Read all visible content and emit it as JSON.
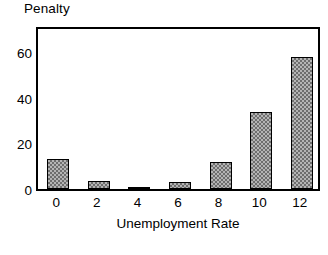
{
  "chart_data": {
    "type": "bar",
    "title": "Penalty",
    "xlabel": "Unemployment Rate",
    "ylabel": "Penalty",
    "categories": [
      "0",
      "2",
      "4",
      "6",
      "8",
      "10",
      "12"
    ],
    "values": [
      13,
      3.5,
      0.3,
      3,
      12,
      34,
      58
    ],
    "xtick_labels": [
      "0",
      "2",
      "4",
      "6",
      "8",
      "10",
      "12"
    ],
    "ytick_labels": [
      "0",
      "20",
      "40",
      "60"
    ],
    "ytick_values": [
      0,
      20,
      40,
      60
    ],
    "ylim": [
      0,
      72
    ],
    "xlim": [
      -1,
      13
    ],
    "grid": false,
    "legend": null,
    "series": [
      {
        "name": "Penalty",
        "values": [
          13,
          3.5,
          0.3,
          3,
          12,
          34,
          58
        ]
      }
    ],
    "bar_fill": "#b4b4b4",
    "bar_edge": "#000000",
    "frame_color": "#000000",
    "background": "#ffffff"
  }
}
